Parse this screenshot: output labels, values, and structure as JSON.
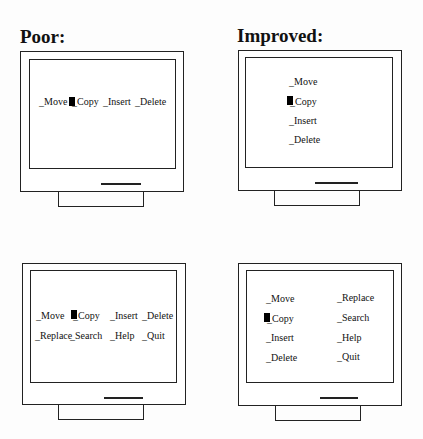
{
  "panels": [
    {
      "id": "poor-1",
      "heading": "Poor:",
      "menu_items": [
        "_Move",
        "_Copy",
        "_Insert",
        "_Delete"
      ],
      "selected": "_Copy",
      "layout": "single-row"
    },
    {
      "id": "improved-1",
      "heading": "Improved:",
      "menu_items": [
        "_Move",
        "_Copy",
        "_Insert",
        "_Delete"
      ],
      "selected": "_Copy",
      "layout": "single-column"
    },
    {
      "id": "poor-2",
      "heading": "",
      "menu_items": [
        "_Move",
        "_Copy",
        "_Insert",
        "_Delete",
        "_Replace",
        "_Search",
        "_Help",
        "_Quit"
      ],
      "selected": "_Copy",
      "layout": "two-rows"
    },
    {
      "id": "improved-2",
      "heading": "",
      "menu_items": [
        "_Move",
        "_Copy",
        "_Insert",
        "_Delete",
        "_Replace",
        "_Search",
        "_Help",
        "_Quit"
      ],
      "selected": "_Copy",
      "layout": "two-columns"
    }
  ],
  "colors": {
    "line": "#222222",
    "background": "#fdfdfd",
    "cursor": "#000000"
  }
}
